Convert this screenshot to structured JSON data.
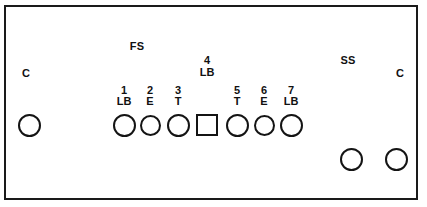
{
  "diagram": {
    "frame": {
      "border_color": "#1a1a1a",
      "background": "#ffffff"
    },
    "group_labels": [
      {
        "id": "left-c",
        "text": "C",
        "x": 26,
        "y": 68
      },
      {
        "id": "fs",
        "text": "FS",
        "x": 137,
        "y": 41
      },
      {
        "id": "ss",
        "text": "SS",
        "x": 348,
        "y": 55
      },
      {
        "id": "right-c",
        "text": "C",
        "x": 400,
        "y": 68
      }
    ],
    "terminals": [
      {
        "id": "terminal-left-c",
        "shape": "circle",
        "number": "",
        "code": "",
        "group": "C",
        "x": 18,
        "y": 114,
        "size": 23
      },
      {
        "id": "terminal-1",
        "shape": "circle",
        "number": "1",
        "code": "LB",
        "group": "FS",
        "x": 113,
        "y": 114,
        "size": 23
      },
      {
        "id": "terminal-2",
        "shape": "circle",
        "number": "2",
        "code": "E",
        "group": "FS",
        "x": 140,
        "y": 115,
        "size": 21
      },
      {
        "id": "terminal-3",
        "shape": "circle",
        "number": "3",
        "code": "T",
        "group": "FS",
        "x": 167,
        "y": 114,
        "size": 23
      },
      {
        "id": "terminal-4",
        "shape": "square",
        "number": "4",
        "code": "LB",
        "group": "",
        "x": 196,
        "y": 114,
        "size": 22
      },
      {
        "id": "terminal-5",
        "shape": "circle",
        "number": "5",
        "code": "T",
        "group": "",
        "x": 226,
        "y": 114,
        "size": 23
      },
      {
        "id": "terminal-6",
        "shape": "circle",
        "number": "6",
        "code": "E",
        "group": "",
        "x": 254,
        "y": 115,
        "size": 21
      },
      {
        "id": "terminal-7",
        "shape": "circle",
        "number": "7",
        "code": "LB",
        "group": "",
        "x": 280,
        "y": 114,
        "size": 23
      },
      {
        "id": "terminal-ss",
        "shape": "circle",
        "number": "",
        "code": "",
        "group": "SS",
        "x": 340,
        "y": 148,
        "size": 23
      },
      {
        "id": "terminal-right-c",
        "shape": "circle",
        "number": "",
        "code": "",
        "group": "C",
        "x": 385,
        "y": 148,
        "size": 23
      }
    ],
    "number_row_y": 85,
    "code_row_y": 96,
    "label_4_number_y": 55,
    "label_4_code_y": 67
  }
}
